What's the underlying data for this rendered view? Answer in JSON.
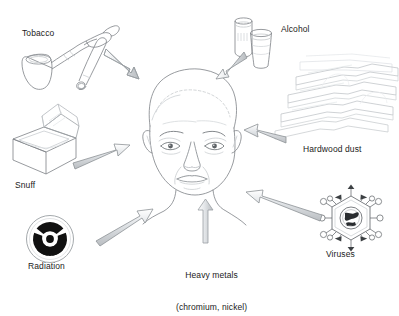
{
  "figure": {
    "type": "diagram",
    "center_node": {
      "name": "human-head",
      "description": "Line drawing of an older man's face, front view, balding"
    },
    "labels": {
      "tobacco": "Tobacco",
      "alcohol": "Alcohol",
      "hardwood_dust": "Hardwood dust",
      "snuff": "Snuff",
      "radiation": "Radiation",
      "viruses": "Viruses",
      "heavy_metals_line1": "Heavy metals",
      "heavy_metals_line2": "(chromium, nickel)"
    },
    "icons": {
      "tobacco": "smoking-pipe-icon",
      "alcohol": "drink-can-and-cup-icon",
      "hardwood_dust": "stacked-wooden-planks-icon",
      "snuff": "open-snuff-box-icon",
      "radiation": "radiation-trefoil-icon",
      "viruses": "hexagonal-virus-icon",
      "heavy_metals": "arrow-only-icon"
    },
    "arrows": [
      {
        "from": "tobacco",
        "to": "head",
        "direction": "down-right"
      },
      {
        "from": "alcohol",
        "to": "head",
        "direction": "down-left"
      },
      {
        "from": "hardwood_dust",
        "to": "head",
        "direction": "left"
      },
      {
        "from": "snuff",
        "to": "head",
        "direction": "up-right"
      },
      {
        "from": "radiation",
        "to": "head",
        "direction": "up-right"
      },
      {
        "from": "heavy_metals",
        "to": "head",
        "direction": "up"
      },
      {
        "from": "viruses",
        "to": "head",
        "direction": "up-left"
      }
    ],
    "colors": {
      "background": "#ffffff",
      "line": "#6e7276",
      "line_light": "#c9cdd1",
      "arrow_fill": "#d9dcdf",
      "arrow_stroke": "#8d9295",
      "text": "#1b1b1b",
      "radiation_symbol": "#111111"
    }
  }
}
